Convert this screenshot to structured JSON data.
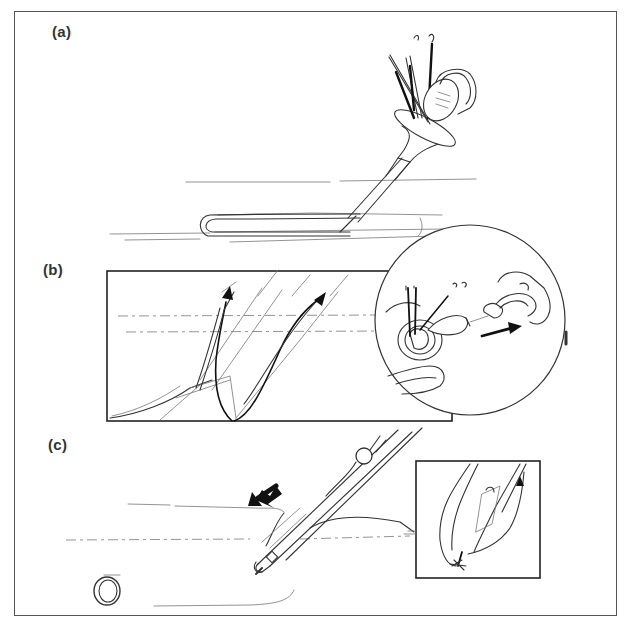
{
  "figure": {
    "panels": [
      {
        "id": "a",
        "label": "(a)"
      },
      {
        "id": "b",
        "label": "(b)"
      },
      {
        "id": "c",
        "label": "(c)"
      }
    ]
  },
  "colors": {
    "line": "#333333",
    "frame": "#555555",
    "background": "#ffffff"
  }
}
